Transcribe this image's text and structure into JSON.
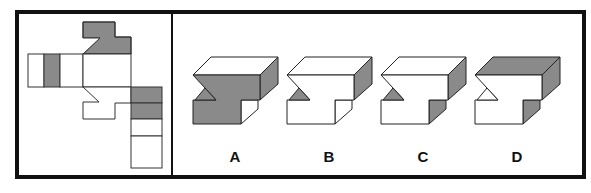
{
  "puzzle": {
    "type": "cube-net-folding",
    "colors": {
      "grey": "#8a8a8a",
      "white": "#ffffff",
      "line": "#222222",
      "frame": "#111111"
    },
    "net": {
      "description": "Unfolded net of a notched block with grey-shaded faces",
      "faces": [
        {
          "id": "top-tab",
          "fill": "grey"
        },
        {
          "id": "left-strip-1",
          "fill": "white"
        },
        {
          "id": "left-strip-2",
          "fill": "grey"
        },
        {
          "id": "left-strip-3",
          "fill": "white"
        },
        {
          "id": "center-face",
          "fill": "white"
        },
        {
          "id": "bottom-notched-face",
          "fill": "white"
        },
        {
          "id": "right-col-1",
          "fill": "grey"
        },
        {
          "id": "right-col-2",
          "fill": "grey"
        },
        {
          "id": "right-col-3",
          "fill": "white"
        },
        {
          "id": "right-col-4",
          "fill": "white"
        }
      ]
    },
    "options": [
      {
        "label": "A",
        "top": "white",
        "front": "grey",
        "triangle": "grey",
        "right": "grey",
        "step": "white"
      },
      {
        "label": "B",
        "top": "white",
        "front": "white",
        "triangle": "grey",
        "right": "grey",
        "step": "white"
      },
      {
        "label": "C",
        "top": "white",
        "front": "white",
        "triangle": "grey",
        "right": "grey",
        "step": "grey"
      },
      {
        "label": "D",
        "top": "grey",
        "front": "white",
        "triangle": "white",
        "right": "grey",
        "step": "grey"
      }
    ]
  }
}
